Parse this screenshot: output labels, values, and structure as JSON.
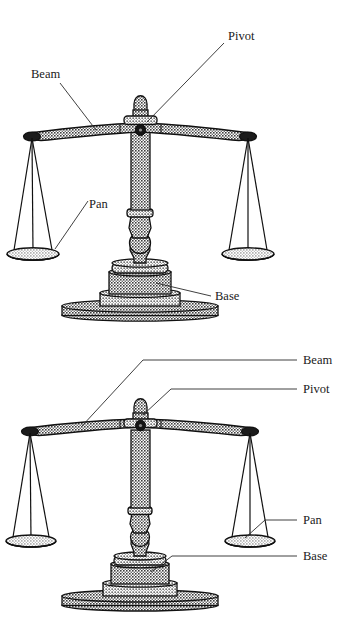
{
  "figure": {
    "type": "diagram",
    "panels": [
      {
        "id": "top",
        "name": "balance-scale-diagram-upper",
        "label_style": "angled-leader-lines",
        "labels": [
          {
            "key": "pivot",
            "text": "Pivot",
            "position": "upper-right"
          },
          {
            "key": "beam",
            "text": "Beam",
            "position": "upper-left"
          },
          {
            "key": "pan",
            "text": "Pan",
            "position": "center-left"
          },
          {
            "key": "base",
            "text": "Base",
            "position": "lower-right"
          }
        ]
      },
      {
        "id": "bottom",
        "name": "balance-scale-diagram-lower",
        "label_style": "right-margin-callouts",
        "labels": [
          {
            "key": "beam",
            "text": "Beam",
            "position": "right-margin-1"
          },
          {
            "key": "pivot",
            "text": "Pivot",
            "position": "right-margin-2"
          },
          {
            "key": "pan",
            "text": "Pan",
            "position": "right-margin-3"
          },
          {
            "key": "base",
            "text": "Base",
            "position": "right-margin-4"
          }
        ]
      }
    ],
    "parts": [
      "Beam",
      "Pivot",
      "Pan",
      "Base"
    ],
    "colors": {
      "outline": "#111111",
      "fill_hatch_dark": "#4d4d4d",
      "fill_hatch_light": "#9a9a9a",
      "background": "#ffffff",
      "label_text": "#1a1a1a",
      "leader_line": "#2a2a2a"
    }
  }
}
